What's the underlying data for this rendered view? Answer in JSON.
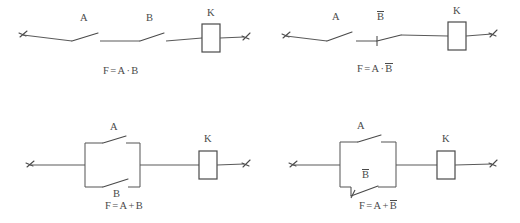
{
  "figure": {
    "background": "#ffffff",
    "line_color": "#5a5a5a",
    "text_color": "#4a4a4a"
  },
  "circuits": [
    {
      "id": "series-a-and-b",
      "description": "Series connection of normally-open contacts A and B driving relay coil K",
      "labels": {
        "switch1": "A",
        "switch1_type": "normally-open",
        "switch2": "B",
        "switch2_type": "normally-open",
        "coil": "K"
      },
      "formula": {
        "lhs": "F",
        "eq": "=",
        "term1": "A",
        "operator": "·",
        "term2": "B",
        "term2_negated": false,
        "plain": "F = A·B"
      }
    },
    {
      "id": "series-a-and-notb",
      "description": "Series connection of normally-open contact A and normally-closed contact B-bar driving relay coil K",
      "labels": {
        "switch1": "A",
        "switch1_type": "normally-open",
        "switch2": "B",
        "switch2_negated": true,
        "switch2_type": "normally-closed",
        "coil": "K"
      },
      "formula": {
        "lhs": "F",
        "eq": "=",
        "term1": "A",
        "operator": "·",
        "term2": "B",
        "term2_negated": true,
        "plain": "F = A·B̅"
      }
    },
    {
      "id": "parallel-a-or-b",
      "description": "Parallel connection of normally-open contacts A and B driving relay coil K",
      "labels": {
        "switch1": "A",
        "switch1_type": "normally-open",
        "switch2": "B",
        "switch2_type": "normally-open",
        "coil": "K"
      },
      "formula": {
        "lhs": "F",
        "eq": "=",
        "term1": "A",
        "operator": "+",
        "term2": "B",
        "term2_negated": false,
        "plain": "F = A + B"
      }
    },
    {
      "id": "parallel-a-or-notb",
      "description": "Parallel connection of normally-open contact A and normally-closed contact B-bar driving relay coil K",
      "labels": {
        "switch1": "A",
        "switch1_type": "normally-open",
        "switch2": "B",
        "switch2_negated": true,
        "switch2_type": "normally-closed",
        "coil": "K"
      },
      "formula": {
        "lhs": "F",
        "eq": "=",
        "term1": "A",
        "operator": "+",
        "term2": "B",
        "term2_negated": true,
        "plain": "F = A + B̅"
      }
    }
  ]
}
